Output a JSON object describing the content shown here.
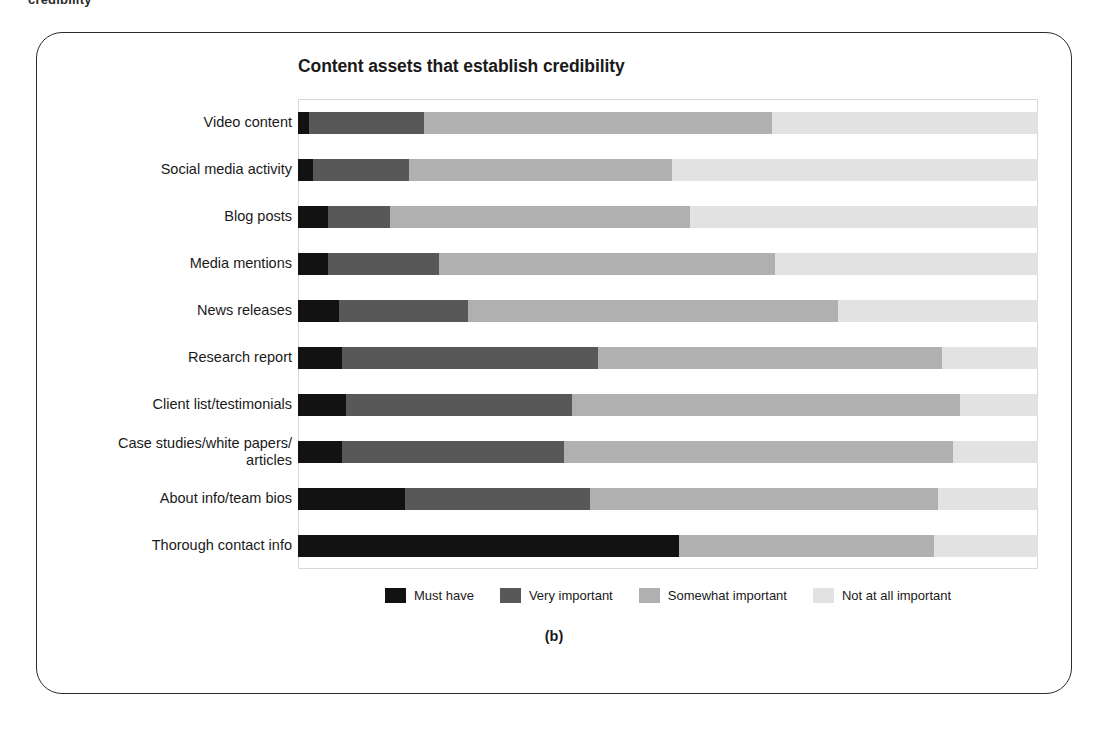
{
  "page": {
    "running_text": "credibility",
    "caption": "(b)"
  },
  "chart_data": {
    "type": "bar",
    "subtype": "stacked-horizontal-100",
    "title": "Content assets that establish credibility",
    "xlabel": "",
    "ylabel": "",
    "xlim": [
      0,
      100
    ],
    "grid": false,
    "legend_position": "bottom",
    "categories": [
      "Video content",
      "Social media activity",
      "Blog posts",
      "Media mentions",
      "News releases",
      "Research report",
      "Client list/testimonials",
      "Case studies/white papers/\narticles",
      "About info/team bios",
      "Thorough contact info"
    ],
    "series": [
      {
        "name": "Must have",
        "color": "#121212",
        "values": [
          1.5,
          2.0,
          4.0,
          4.0,
          5.5,
          6.0,
          6.5,
          6.0,
          14.5,
          51.5
        ]
      },
      {
        "name": "Very important",
        "color": "#585858",
        "values": [
          15.5,
          13.0,
          8.5,
          15.0,
          17.5,
          34.5,
          30.5,
          30.0,
          25.0,
          0.0
        ]
      },
      {
        "name": "Somewhat important",
        "color": "#b0b0b0",
        "values": [
          47.0,
          35.5,
          40.5,
          45.5,
          50.0,
          46.5,
          52.5,
          52.5,
          47.0,
          34.5
        ]
      },
      {
        "name": "Not at all important",
        "color": "#e2e2e2",
        "values": [
          36.0,
          49.5,
          47.0,
          35.5,
          27.0,
          13.0,
          10.5,
          11.5,
          13.5,
          14.0
        ]
      }
    ]
  }
}
